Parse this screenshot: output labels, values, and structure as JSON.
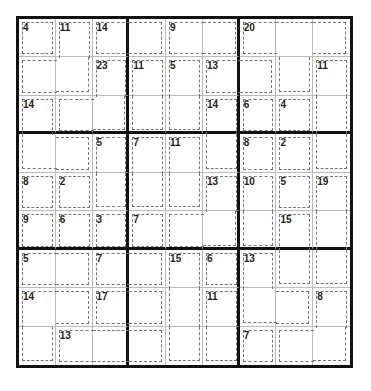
{
  "puzzle": {
    "type": "Killer Sudoku",
    "rows": 9,
    "cols": 9,
    "cages": [
      {
        "sum": "4",
        "cells": [
          [
            0,
            0
          ]
        ]
      },
      {
        "sum": "11",
        "cells": [
          [
            0,
            1
          ],
          [
            1,
            0
          ],
          [
            1,
            1
          ]
        ]
      },
      {
        "sum": "14",
        "cells": [
          [
            0,
            2
          ],
          [
            0,
            3
          ]
        ]
      },
      {
        "sum": "9",
        "cells": [
          [
            0,
            4
          ],
          [
            0,
            5
          ]
        ]
      },
      {
        "sum": "20",
        "cells": [
          [
            0,
            6
          ],
          [
            0,
            7
          ],
          [
            0,
            8
          ],
          [
            1,
            7
          ]
        ]
      },
      {
        "sum": "23",
        "cells": [
          [
            1,
            2
          ],
          [
            2,
            1
          ],
          [
            2,
            2
          ]
        ]
      },
      {
        "sum": "11",
        "cells": [
          [
            1,
            3
          ],
          [
            2,
            3
          ]
        ]
      },
      {
        "sum": "5",
        "cells": [
          [
            1,
            4
          ],
          [
            2,
            4
          ]
        ]
      },
      {
        "sum": "13",
        "cells": [
          [
            1,
            5
          ],
          [
            1,
            6
          ]
        ]
      },
      {
        "sum": "11",
        "cells": [
          [
            1,
            8
          ],
          [
            2,
            8
          ],
          [
            3,
            8
          ]
        ]
      },
      {
        "sum": "14",
        "cells": [
          [
            2,
            0
          ],
          [
            3,
            0
          ],
          [
            3,
            1
          ]
        ]
      },
      {
        "sum": "14",
        "cells": [
          [
            2,
            5
          ],
          [
            3,
            5
          ]
        ]
      },
      {
        "sum": "6",
        "cells": [
          [
            2,
            6
          ]
        ]
      },
      {
        "sum": "4",
        "cells": [
          [
            2,
            7
          ]
        ]
      },
      {
        "sum": "5",
        "cells": [
          [
            3,
            2
          ],
          [
            4,
            2
          ]
        ]
      },
      {
        "sum": "7",
        "cells": [
          [
            3,
            3
          ],
          [
            4,
            3
          ]
        ]
      },
      {
        "sum": "11",
        "cells": [
          [
            3,
            4
          ],
          [
            4,
            4
          ]
        ]
      },
      {
        "sum": "8",
        "cells": [
          [
            3,
            6
          ]
        ]
      },
      {
        "sum": "2",
        "cells": [
          [
            3,
            7
          ]
        ]
      },
      {
        "sum": "8",
        "cells": [
          [
            4,
            0
          ]
        ]
      },
      {
        "sum": "2",
        "cells": [
          [
            4,
            1
          ]
        ]
      },
      {
        "sum": "13",
        "cells": [
          [
            4,
            5
          ],
          [
            5,
            4
          ],
          [
            5,
            5
          ]
        ]
      },
      {
        "sum": "10",
        "cells": [
          [
            4,
            6
          ],
          [
            5,
            6
          ]
        ]
      },
      {
        "sum": "5",
        "cells": [
          [
            4,
            7
          ]
        ]
      },
      {
        "sum": "19",
        "cells": [
          [
            4,
            8
          ],
          [
            5,
            8
          ],
          [
            6,
            8
          ]
        ]
      },
      {
        "sum": "9",
        "cells": [
          [
            5,
            0
          ]
        ]
      },
      {
        "sum": "6",
        "cells": [
          [
            5,
            1
          ]
        ]
      },
      {
        "sum": "3",
        "cells": [
          [
            5,
            2
          ]
        ]
      },
      {
        "sum": "7",
        "cells": [
          [
            5,
            3
          ]
        ]
      },
      {
        "sum": "15",
        "cells": [
          [
            5,
            7
          ],
          [
            6,
            7
          ]
        ]
      },
      {
        "sum": "5",
        "cells": [
          [
            6,
            0
          ],
          [
            6,
            1
          ]
        ]
      },
      {
        "sum": "7",
        "cells": [
          [
            6,
            2
          ],
          [
            6,
            3
          ]
        ]
      },
      {
        "sum": "15",
        "cells": [
          [
            6,
            4
          ],
          [
            7,
            4
          ],
          [
            8,
            4
          ]
        ]
      },
      {
        "sum": "6",
        "cells": [
          [
            6,
            5
          ]
        ]
      },
      {
        "sum": "13",
        "cells": [
          [
            6,
            6
          ],
          [
            7,
            6
          ],
          [
            7,
            7
          ]
        ]
      },
      {
        "sum": "14",
        "cells": [
          [
            7,
            0
          ],
          [
            7,
            1
          ],
          [
            8,
            0
          ]
        ]
      },
      {
        "sum": "17",
        "cells": [
          [
            7,
            2
          ],
          [
            7,
            3
          ]
        ]
      },
      {
        "sum": "11",
        "cells": [
          [
            7,
            5
          ],
          [
            8,
            5
          ]
        ]
      },
      {
        "sum": "8",
        "cells": [
          [
            7,
            8
          ],
          [
            8,
            7
          ],
          [
            8,
            8
          ]
        ]
      },
      {
        "sum": "13",
        "cells": [
          [
            8,
            1
          ],
          [
            8,
            2
          ],
          [
            8,
            3
          ]
        ]
      },
      {
        "sum": "7",
        "cells": [
          [
            8,
            6
          ]
        ]
      }
    ]
  }
}
